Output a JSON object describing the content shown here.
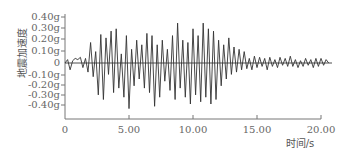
{
  "chart_data": {
    "type": "line",
    "title": "",
    "xlabel": "时间/s",
    "ylabel": "地震加速度",
    "xlim": [
      0,
      20.7
    ],
    "ylim": [
      -0.45,
      0.45
    ],
    "grid": false,
    "legend": null,
    "x_ticks": [
      0,
      5,
      10,
      15,
      20
    ],
    "x_tick_labels": [
      "0",
      "5.00",
      "10.00",
      "15.00",
      "20.00"
    ],
    "y_ticks": [
      0.4,
      0.3,
      0.2,
      0.1,
      0,
      -0.1,
      -0.2,
      -0.3,
      -0.4
    ],
    "y_tick_labels": [
      "0.40g",
      "0.30g",
      "0.20g",
      "0.10g",
      "0",
      "-0.10g",
      "-0.20g",
      "-0.30g",
      "-0.40g"
    ],
    "zero_line": true,
    "series": [
      {
        "name": "地震加速度",
        "color": "#333333",
        "x": [
          0.0,
          0.2,
          0.4,
          0.6,
          0.8,
          1.0,
          1.2,
          1.4,
          1.6,
          1.8,
          2.0,
          2.2,
          2.4,
          2.6,
          2.8,
          3.0,
          3.2,
          3.4,
          3.6,
          3.8,
          4.0,
          4.2,
          4.4,
          4.6,
          4.8,
          5.0,
          5.2,
          5.4,
          5.6,
          5.8,
          6.0,
          6.2,
          6.4,
          6.6,
          6.8,
          7.0,
          7.2,
          7.4,
          7.6,
          7.8,
          8.0,
          8.2,
          8.4,
          8.6,
          8.8,
          9.0,
          9.2,
          9.4,
          9.6,
          9.8,
          10.0,
          10.2,
          10.4,
          10.6,
          10.8,
          11.0,
          11.2,
          11.4,
          11.6,
          11.8,
          12.0,
          12.2,
          12.4,
          12.6,
          12.8,
          13.0,
          13.2,
          13.4,
          13.6,
          13.8,
          14.0,
          14.2,
          14.4,
          14.6,
          14.8,
          15.0,
          15.2,
          15.4,
          15.6,
          15.8,
          16.0,
          16.2,
          16.4,
          16.6,
          16.8,
          17.0,
          17.2,
          17.4,
          17.6,
          17.8,
          18.0,
          18.2,
          18.4,
          18.6,
          18.8,
          19.0,
          19.2,
          19.4,
          19.6,
          19.8,
          20.0,
          20.2,
          20.4,
          20.6
        ],
        "y": [
          0.0,
          0.03,
          -0.06,
          0.02,
          0.04,
          0.03,
          0.05,
          -0.04,
          0.04,
          -0.08,
          0.18,
          -0.12,
          0.1,
          -0.28,
          0.25,
          -0.32,
          0.22,
          -0.1,
          0.28,
          -0.26,
          0.3,
          -0.22,
          0.08,
          -0.3,
          0.24,
          -0.4,
          0.12,
          -0.2,
          0.2,
          -0.14,
          0.16,
          -0.22,
          0.26,
          -0.26,
          0.24,
          -0.38,
          0.16,
          -0.3,
          0.2,
          -0.16,
          0.12,
          -0.24,
          0.24,
          -0.32,
          0.35,
          -0.22,
          0.2,
          -0.3,
          0.18,
          -0.36,
          0.3,
          -0.28,
          0.24,
          -0.34,
          0.35,
          -0.3,
          0.3,
          -0.36,
          0.28,
          -0.32,
          0.2,
          -0.2,
          0.16,
          -0.14,
          0.22,
          -0.1,
          0.14,
          -0.08,
          0.12,
          -0.06,
          0.1,
          -0.05,
          0.04,
          -0.06,
          0.06,
          -0.04,
          0.05,
          -0.03,
          0.04,
          -0.06,
          0.05,
          -0.03,
          0.03,
          -0.04,
          0.05,
          -0.02,
          0.04,
          -0.03,
          0.06,
          -0.03,
          0.03,
          -0.04,
          0.02,
          -0.03,
          0.04,
          -0.02,
          0.03,
          -0.04,
          0.04,
          -0.03,
          0.04,
          -0.02,
          0.03,
          0.0
        ]
      }
    ]
  },
  "axes": {
    "y_title": "地震加速度",
    "x_title": "时间/s",
    "y_ticks": [
      {
        "label": "0.40g"
      },
      {
        "label": "0.30g"
      },
      {
        "label": "0.20g"
      },
      {
        "label": "0.10g"
      },
      {
        "label": "0"
      },
      {
        "label": "-0.10g"
      },
      {
        "label": "-0.20g"
      },
      {
        "label": "-0.30g"
      },
      {
        "label": "-0.40g"
      }
    ],
    "x_ticks": [
      {
        "label": "0"
      },
      {
        "label": "5.00"
      },
      {
        "label": "10.00"
      },
      {
        "label": "15.00"
      },
      {
        "label": "20.00"
      }
    ]
  }
}
